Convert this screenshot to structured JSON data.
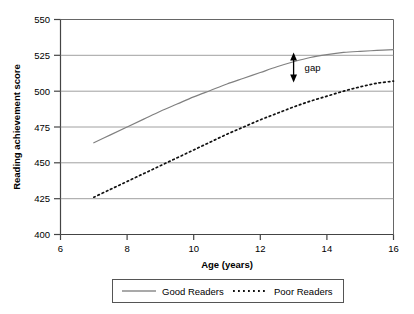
{
  "chart_data": {
    "type": "line",
    "title": "",
    "xlabel": "Age (years)",
    "ylabel": "Reading achievement score",
    "xlim": [
      6,
      16
    ],
    "ylim": [
      400,
      550
    ],
    "xticks": [
      "6",
      "8",
      "10",
      "12",
      "14",
      "16"
    ],
    "yticks": [
      "400",
      "425",
      "450",
      "475",
      "500",
      "525",
      "550"
    ],
    "grid": "horizontal",
    "legend_position": "below",
    "series": [
      {
        "name": "Good Readers",
        "style": "solid",
        "color": "#808080",
        "x": [
          7,
          7.5,
          8,
          8.5,
          9,
          9.5,
          10,
          10.5,
          11,
          11.5,
          12,
          12.5,
          13,
          13.5,
          14,
          14.5,
          15,
          15.5,
          16
        ],
        "values": [
          464,
          469.5,
          475,
          480.5,
          486,
          491,
          496,
          500.5,
          505,
          509,
          513,
          517,
          520.5,
          523.5,
          525.5,
          527,
          527.8,
          528.4,
          529
        ]
      },
      {
        "name": "Poor Readers",
        "style": "dotted",
        "color": "#000000",
        "x": [
          7,
          7.5,
          8,
          8.5,
          9,
          9.5,
          10,
          10.5,
          11,
          11.5,
          12,
          12.5,
          13,
          13.5,
          14,
          14.5,
          15,
          15.5,
          16
        ],
        "values": [
          426,
          431.5,
          437,
          442.5,
          448,
          453.5,
          459,
          464.5,
          470,
          475,
          480,
          484.5,
          489,
          493,
          496.5,
          500,
          503,
          505.5,
          507
        ]
      }
    ],
    "annotations": [
      {
        "name": "gap",
        "label": "gap",
        "x": 13,
        "y_top": 527,
        "y_bottom": 506,
        "arrow": "double-headed"
      }
    ]
  },
  "legend": {
    "items": [
      {
        "label": "Good Readers",
        "style": "solid"
      },
      {
        "label": "Poor Readers",
        "style": "dotted"
      }
    ]
  }
}
